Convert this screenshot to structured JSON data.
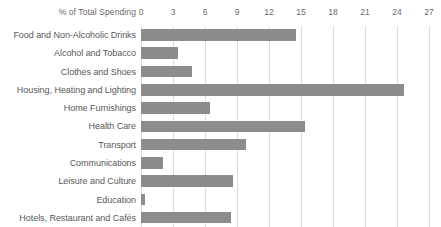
{
  "chart_data": {
    "type": "bar",
    "orientation": "horizontal",
    "title": "",
    "xlabel": "% of Total Spending",
    "ylabel": "",
    "xlim": [
      0,
      27
    ],
    "xticks": [
      0,
      3,
      6,
      9,
      12,
      15,
      18,
      21,
      24,
      27
    ],
    "grid": true,
    "legend": false,
    "bar_color": "#8c8c8c",
    "gridline_color": "#dcdcde",
    "categories": [
      "Food and Non-Alcoholic Drinks",
      "Alcohol and Tobacco",
      "Clothes and Shoes",
      "Housing, Heating and Lighting",
      "Home Furnishings",
      "Health Care",
      "Transport",
      "Communications",
      "Leisure and Culture",
      "Education",
      "Hotels, Restaurant and Cafés"
    ],
    "values": [
      14.5,
      3.5,
      4.8,
      24.7,
      6.5,
      15.4,
      9.8,
      2.1,
      8.6,
      0.4,
      8.4
    ]
  }
}
